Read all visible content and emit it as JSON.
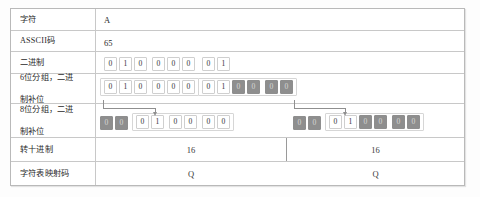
{
  "table": {
    "rows": [
      {
        "label": "字符",
        "type": "plain",
        "value": "A"
      },
      {
        "label": "ASSCII码",
        "type": "plain",
        "value": "65"
      },
      {
        "label": "二进制",
        "type": "bits",
        "groups": [
          {
            "bits": [
              "0",
              "1",
              "0",
              "0",
              "0",
              "0"
            ],
            "pads": []
          },
          {
            "bits": [
              "0",
              "1"
            ],
            "pads": []
          }
        ]
      },
      {
        "label_line1": "6位分组，二进",
        "label_line2": "制补位",
        "label": "6位分组，二进制补位",
        "type": "bits",
        "groups": [
          {
            "bits": [
              "0",
              "1",
              "0",
              "0",
              "0",
              "0"
            ],
            "pads": []
          },
          {
            "bits": [
              "0",
              "1",
              "0",
              "0",
              "0",
              "0"
            ],
            "pads": [
              2,
              3,
              4,
              5
            ]
          }
        ]
      },
      {
        "label_line1": "8位分组，二进",
        "label_line2": "制补位",
        "label": "8位分组，二进制补位",
        "type": "bits",
        "groups": [
          {
            "bits": [
              "0",
              "0"
            ],
            "pads": [
              0,
              1
            ]
          },
          {
            "bits": [
              "0",
              "1",
              "0",
              "0",
              "0",
              "0"
            ],
            "pads": []
          },
          {
            "bits": [
              "0",
              "0"
            ],
            "pads": [
              0,
              1
            ]
          },
          {
            "bits": [
              "0",
              "1",
              "0",
              "0",
              "0",
              "0"
            ],
            "pads": [
              2,
              3,
              4,
              5
            ]
          }
        ]
      },
      {
        "label": "转十进制",
        "type": "split",
        "left": "16",
        "right": "16"
      },
      {
        "label": "字符表映射码",
        "type": "split",
        "left": "Q",
        "right": "Q"
      }
    ]
  },
  "colors": {
    "border": "#b9b9b9",
    "grid": "#c8c8c8",
    "pad_fill": "#8e8e8e",
    "bit_border": "#cfcfcf",
    "connector": "#8f8f8f",
    "background": "#fdfdfd"
  }
}
